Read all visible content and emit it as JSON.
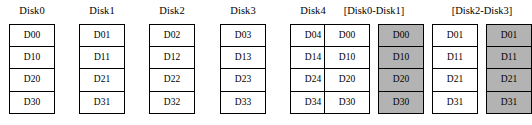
{
  "diagram": {
    "cell_fill_plain": "#ffffff",
    "cell_fill_shaded": "#b3b3b3",
    "border_color": "#000000",
    "background": "#ffffff",
    "columns": [
      {
        "id": "disk0",
        "label": "Disk0",
        "shaded": false,
        "group": null,
        "cells": [
          "D00",
          "D10",
          "D20",
          "D30"
        ]
      },
      {
        "id": "disk1",
        "label": "Disk1",
        "shaded": false,
        "group": null,
        "cells": [
          "D01",
          "D11",
          "D21",
          "D31"
        ]
      },
      {
        "id": "disk2",
        "label": "Disk2",
        "shaded": false,
        "group": null,
        "cells": [
          "D02",
          "D12",
          "D22",
          "D32"
        ]
      },
      {
        "id": "disk3",
        "label": "Disk3",
        "shaded": false,
        "group": null,
        "cells": [
          "D03",
          "D13",
          "D23",
          "D33"
        ]
      },
      {
        "id": "disk4",
        "label": "Disk4",
        "shaded": false,
        "group": null,
        "cells": [
          "D04",
          "D14",
          "D24",
          "D34"
        ]
      },
      {
        "id": "mirror-a-primary",
        "label": "",
        "shaded": false,
        "group": "[Disk0-Disk1]",
        "cells": [
          "D00",
          "D10",
          "D20",
          "D30"
        ]
      },
      {
        "id": "mirror-a-copy",
        "label": "",
        "shaded": true,
        "group": "[Disk0-Disk1]",
        "cells": [
          "D00",
          "D10",
          "D20",
          "D30"
        ]
      },
      {
        "id": "mirror-b-primary",
        "label": "",
        "shaded": false,
        "group": "[Disk2-Disk3]",
        "cells": [
          "D01",
          "D11",
          "D21",
          "D31"
        ]
      },
      {
        "id": "mirror-b-copy",
        "label": "",
        "shaded": true,
        "group": "[Disk2-Disk3]",
        "cells": [
          "D01",
          "D11",
          "D21",
          "D31"
        ]
      }
    ],
    "groups": [
      {
        "id": "group-disk0-disk1",
        "label": "[Disk0-Disk1]"
      },
      {
        "id": "group-disk2-disk3",
        "label": "[Disk2-Disk3]"
      }
    ]
  },
  "layout": {
    "column_x": [
      8,
      79,
      150,
      220,
      291,
      362,
      433,
      504,
      575
    ],
    "group_x": [
      291,
      433
    ]
  }
}
